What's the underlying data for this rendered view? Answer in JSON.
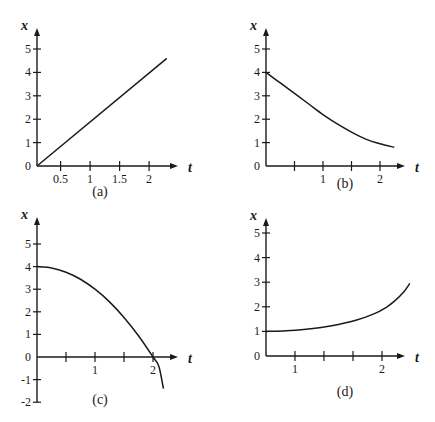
{
  "chart_data": [
    {
      "type": "line",
      "caption": "(a)",
      "xlabel": "t",
      "ylabel": "x",
      "x_origin": 0.1,
      "xlim": [
        0.1,
        2.4
      ],
      "ylim": [
        0,
        5.6
      ],
      "xticks": [
        0.5,
        1,
        1.5,
        2
      ],
      "xtick_labels": [
        "0.5",
        "1",
        "1.5",
        "2"
      ],
      "yticks": [
        0,
        1,
        2,
        3,
        4,
        5
      ],
      "ytick_labels": [
        "0",
        "1",
        "2",
        "3",
        "4",
        "5"
      ],
      "series": [
        {
          "name": "x(t)",
          "x": [
            0.1,
            2.3
          ],
          "y": [
            0,
            4.6
          ]
        }
      ]
    },
    {
      "type": "line",
      "caption": "(b)",
      "xlabel": "t",
      "ylabel": "x",
      "x_origin": 0,
      "xlim": [
        0,
        2.4
      ],
      "ylim": [
        0,
        5.6
      ],
      "xticks": [
        0.5,
        1,
        1.5,
        2
      ],
      "xtick_labels": [
        "",
        "1",
        "",
        "2"
      ],
      "yticks": [
        0,
        1,
        2,
        3,
        4,
        5
      ],
      "ytick_labels": [
        "0",
        "1",
        "2",
        "3",
        "4",
        "5"
      ],
      "series": [
        {
          "name": "x(t)",
          "x": [
            0,
            0.25,
            0.5,
            0.75,
            1.0,
            1.25,
            1.5,
            1.75,
            2.0,
            2.25
          ],
          "y": [
            4.0,
            3.55,
            3.1,
            2.65,
            2.2,
            1.8,
            1.45,
            1.15,
            0.95,
            0.8
          ]
        }
      ]
    },
    {
      "type": "line",
      "caption": "(c)",
      "xlabel": "t",
      "ylabel": "x",
      "x_origin": 0,
      "xlim": [
        0,
        2.4
      ],
      "ylim": [
        -2,
        5.6
      ],
      "xticks": [
        0.5,
        1,
        1.5,
        2
      ],
      "xtick_labels": [
        "",
        "1",
        "",
        "2"
      ],
      "yticks": [
        -2,
        -1,
        0,
        1,
        2,
        3,
        4,
        5
      ],
      "ytick_labels": [
        "-2",
        "-1",
        "0",
        "1",
        "2",
        "3",
        "4",
        "5"
      ],
      "series": [
        {
          "name": "x(t)",
          "x": [
            0,
            0.25,
            0.5,
            0.75,
            1.0,
            1.25,
            1.5,
            1.75,
            2.0,
            2.1,
            2.18
          ],
          "y": [
            4.0,
            3.94,
            3.75,
            3.44,
            3.0,
            2.44,
            1.75,
            0.94,
            0.0,
            -0.41,
            -1.4
          ]
        }
      ]
    },
    {
      "type": "line",
      "caption": "(d)",
      "xlabel": "t",
      "ylabel": "x",
      "x_origin": 0.667,
      "xlim": [
        0.667,
        2.45
      ],
      "ylim": [
        0,
        5.6
      ],
      "xticks": [
        1,
        1.333,
        1.667,
        2
      ],
      "xtick_labels": [
        "1",
        "",
        "",
        "2"
      ],
      "yticks": [
        0,
        1,
        2,
        3,
        4,
        5
      ],
      "ytick_labels": [
        "0",
        "1",
        "2",
        "3",
        "4",
        "5"
      ],
      "series": [
        {
          "name": "x(t)",
          "x": [
            0.667,
            0.9,
            1.1,
            1.3,
            1.5,
            1.7,
            1.9,
            2.05,
            2.15,
            2.25,
            2.32
          ],
          "y": [
            1.0,
            1.03,
            1.08,
            1.16,
            1.28,
            1.45,
            1.7,
            1.98,
            2.25,
            2.6,
            2.95
          ]
        }
      ]
    }
  ]
}
